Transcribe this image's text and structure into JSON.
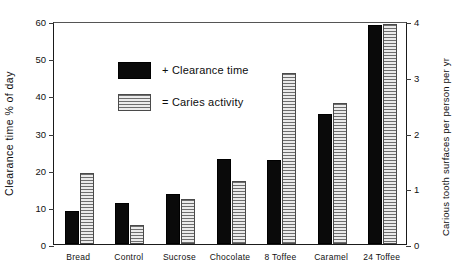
{
  "chart_data": {
    "type": "bar",
    "title": "",
    "subtitle": "",
    "xlabel": "",
    "ylabel": "Clearance time % of day",
    "ylabel_secondary": "Carious tooth surfaces per person per yr",
    "categories": [
      "Bread",
      "Control",
      "Sucrose",
      "Chocolate",
      "8 Toffee",
      "Caramel",
      "24 Toffee"
    ],
    "series": [
      {
        "name": "+ Clearance time",
        "axis": "left",
        "unit": "% of day",
        "values": [
          9,
          11,
          13.5,
          23,
          22.5,
          35,
          59
        ]
      },
      {
        "name": "= Caries activity",
        "axis": "right",
        "unit": "carious tooth surfaces per person per yr",
        "values": [
          1.27,
          0.33,
          0.8,
          1.13,
          3.07,
          2.53,
          3.95
        ],
        "values_left_scale": [
          19,
          5,
          12,
          17,
          46,
          38,
          59.2
        ]
      }
    ],
    "ylim": [
      0,
      60
    ],
    "yticks": [
      0,
      10,
      20,
      30,
      40,
      50,
      60
    ],
    "ylim_secondary": [
      0,
      4
    ],
    "yticks_secondary": [
      0,
      1,
      2,
      3,
      4
    ],
    "grid": false,
    "legend_position": "top-left",
    "colors": {
      "clearance": "#0a0a0a",
      "caries_fill": "#d2d2d2",
      "caries_stripe": "#6e6e6e",
      "axis": "#1a1a1a",
      "background": "#ffffff"
    }
  },
  "legend": {
    "items": [
      {
        "label": "+ Clearance time",
        "swatch": "solid-black-swatch"
      },
      {
        "label": "= Caries activity",
        "swatch": "striped-gray-swatch"
      }
    ]
  }
}
